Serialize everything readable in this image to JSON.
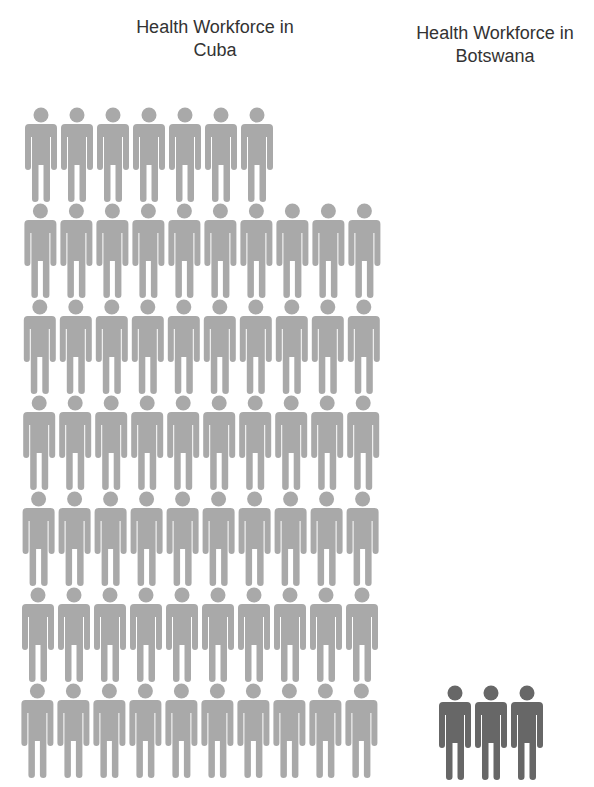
{
  "chart_data": {
    "type": "pictogram",
    "title": "",
    "unit_description": "Each figure represents a unit of health workforce",
    "series": [
      {
        "name": "Cuba",
        "label": "Health Workforce in Cuba",
        "count": 67,
        "icons_per_row": 10,
        "rows": [
          7,
          10,
          10,
          10,
          10,
          10,
          10
        ],
        "color": "#a9a9a9"
      },
      {
        "name": "Botswana",
        "label": "Health Workforce in Botswana",
        "count": 3,
        "icons_per_row": 3,
        "rows": [
          3
        ],
        "color": "#676767"
      }
    ],
    "icon": "person-icon",
    "legend": "none",
    "grid": false
  },
  "labels": {
    "cuba_title_line1": "Health Workforce in",
    "cuba_title_line2": "Cuba",
    "botswana_title_line1": "Health Workforce in",
    "botswana_title_line2": "Botswana"
  }
}
